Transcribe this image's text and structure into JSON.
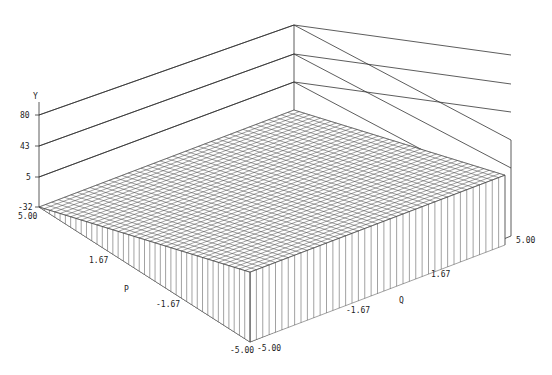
{
  "chart_data": {
    "type": "surface3d",
    "title": "",
    "axes": {
      "y": {
        "label": "Y",
        "ticks": [
          "80",
          "43",
          "5",
          "-32"
        ],
        "range": [
          -32,
          80
        ]
      },
      "p": {
        "label": "P",
        "ticks": [
          "5.00",
          "1.67",
          "-1.67",
          "-5.00"
        ],
        "range": [
          -5,
          5
        ]
      },
      "q": {
        "label": "Q",
        "ticks": [
          "-5.00",
          "-1.67",
          "1.67",
          "5.00"
        ],
        "range": [
          -5,
          5
        ]
      }
    },
    "grid_cells": 40,
    "surface": {
      "description": "tilted plane, Y depends on P only",
      "corners": [
        {
          "p": 5,
          "q": -5,
          "y": -32
        },
        {
          "p": 5,
          "q": 5,
          "y": -32
        },
        {
          "p": -5,
          "q": -5,
          "y": 53
        },
        {
          "p": -5,
          "q": 5,
          "y": 53
        }
      ]
    }
  },
  "labels": {
    "y_axis": "Y",
    "y_80": "80",
    "y_43": "43",
    "y_5": "5",
    "y_m32": "-32",
    "p_axis": "P",
    "p_500": "5.00",
    "p_167": "1.67",
    "p_m167": "-1.67",
    "p_m500": "-5.00",
    "q_axis": "Q",
    "q_m500": "-5.00",
    "q_m167": "-1.67",
    "q_167": "1.67",
    "q_500": "5.00"
  }
}
